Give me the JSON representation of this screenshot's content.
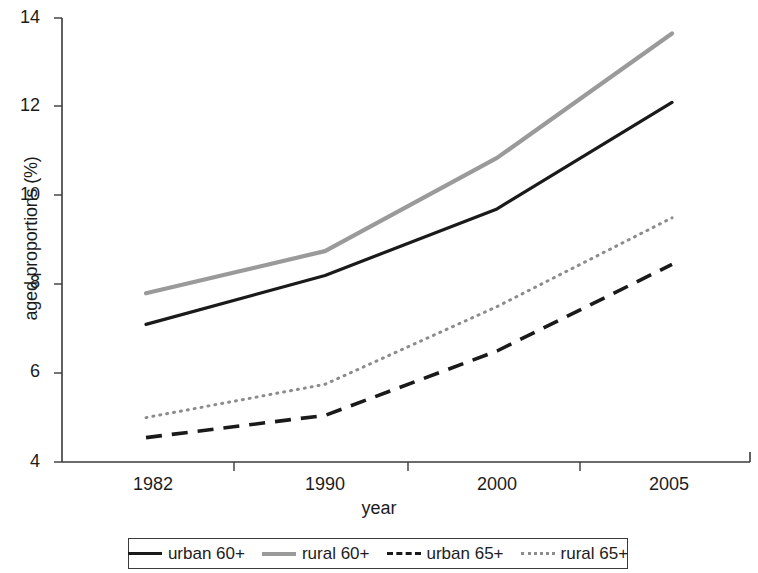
{
  "chart_data": {
    "type": "line",
    "title": "",
    "xlabel": "year",
    "ylabel": "aged proportions (%)",
    "x": [
      "1982",
      "1990",
      "2000",
      "2005"
    ],
    "xtick_labels": [
      "1982",
      "1990",
      "2000",
      "2005"
    ],
    "ytick_labels": [
      "4",
      "6",
      "8",
      "10",
      "12",
      "14"
    ],
    "yticks": [
      4,
      6,
      8,
      10,
      12,
      14
    ],
    "ylim": [
      4,
      14
    ],
    "grid": false,
    "legend_position": "bottom",
    "series": [
      {
        "name": "urban 60+",
        "values": [
          7.1,
          8.2,
          9.7,
          12.1
        ],
        "style": "solid",
        "color": "#1a1a1a"
      },
      {
        "name": "rural 60+",
        "values": [
          7.8,
          8.75,
          10.85,
          13.65
        ],
        "style": "solid",
        "color": "#9a9a9a"
      },
      {
        "name": "urban 65+",
        "values": [
          4.55,
          5.05,
          6.5,
          8.45
        ],
        "style": "dashed",
        "color": "#1a1a1a"
      },
      {
        "name": "rural 65+",
        "values": [
          5.0,
          5.75,
          7.5,
          9.5
        ],
        "style": "dotted",
        "color": "#8c8c8c"
      }
    ]
  },
  "axis": {
    "ylabel": "aged proportions (%)",
    "xlabel": "year",
    "ytick_4": "4",
    "ytick_6": "6",
    "ytick_8": "8",
    "ytick_10": "10",
    "ytick_12": "12",
    "ytick_14": "14",
    "xtick_1982": "1982",
    "xtick_1990": "1990",
    "xtick_2000": "2000",
    "xtick_2005": "2005"
  },
  "legend": {
    "items": [
      {
        "label": "urban 60+",
        "style": "solid",
        "color": "#1a1a1a"
      },
      {
        "label": "rural 60+",
        "style": "solid",
        "color": "#9a9a9a"
      },
      {
        "label": "urban 65+",
        "style": "dashed",
        "color": "#1a1a1a"
      },
      {
        "label": "rural 65+",
        "style": "dotted",
        "color": "#8c8c8c"
      }
    ]
  }
}
